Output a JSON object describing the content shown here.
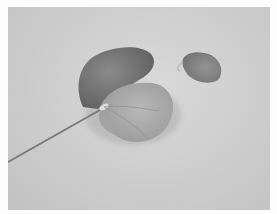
{
  "image": {
    "alt": "Grayscale photograph of a single flower (leaf-like bloom with a long thin stem) lying on a light surface, with a detached petal to its upper right",
    "subject": "flower with stem",
    "secondary_subject": "detached petal",
    "background": "light gray surface",
    "colors": {
      "border": "#fdfdfd",
      "surface": "#cfcfcf",
      "flower_dark": "#6f6f6f",
      "flower_mid": "#999999",
      "flower_light": "#b3b3b3",
      "petal": "#8a8a8a",
      "stem": "#7a7a7a"
    }
  }
}
